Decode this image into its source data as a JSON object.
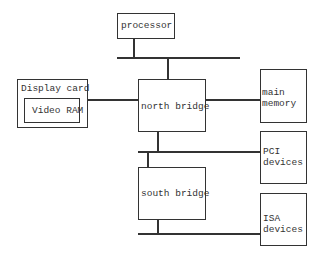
{
  "diagram": {
    "type": "block-diagram",
    "nodes": {
      "processor": {
        "label": "processor"
      },
      "display_card": {
        "label": "Display card"
      },
      "video_ram": {
        "label": "Video RAM"
      },
      "north_bridge": {
        "label": "north bridge"
      },
      "main_memory": {
        "line1": "main",
        "line2": "memory"
      },
      "pci_devices": {
        "line1": "PCI",
        "line2": "devices"
      },
      "south_bridge": {
        "label": "south bridge"
      },
      "isa_devices": {
        "line1": "ISA",
        "line2": "devices"
      }
    },
    "edges": [
      {
        "from": "processor",
        "to": "front-side bus"
      },
      {
        "from": "front-side bus",
        "to": "north_bridge"
      },
      {
        "from": "display_card",
        "to": "north_bridge"
      },
      {
        "from": "north_bridge",
        "to": "main_memory"
      },
      {
        "from": "north_bridge",
        "to": "PCI bus"
      },
      {
        "from": "PCI bus",
        "to": "pci_devices"
      },
      {
        "from": "PCI bus",
        "to": "south_bridge"
      },
      {
        "from": "south_bridge",
        "to": "ISA bus"
      },
      {
        "from": "ISA bus",
        "to": "isa_devices"
      }
    ]
  }
}
